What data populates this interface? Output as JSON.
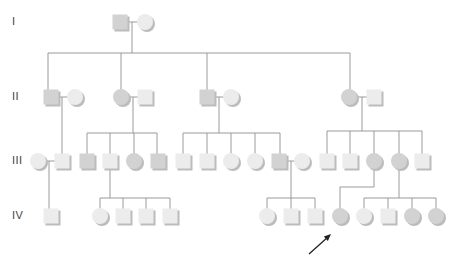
{
  "diagram": {
    "type": "pedigree",
    "colors": {
      "line": "#9a9a9a",
      "unaffected_fill": "#ececec",
      "affected_fill": "#d2d2d2",
      "shadow": "#bcbcbc",
      "arrow": "#222222",
      "label": "#444444"
    },
    "generation_labels": [
      {
        "label": "I",
        "y": 22
      },
      {
        "label": "II",
        "y": 97
      },
      {
        "label": "III",
        "y": 161
      },
      {
        "label": "IV",
        "y": 216
      }
    ],
    "individuals": [
      {
        "id": "I-1",
        "sex": "male",
        "x": 120,
        "y": 22,
        "affected": true
      },
      {
        "id": "I-2",
        "sex": "female",
        "x": 145,
        "y": 22,
        "affected": false
      },
      {
        "id": "II-1",
        "sex": "male",
        "x": 51,
        "y": 97,
        "affected": true
      },
      {
        "id": "II-2",
        "sex": "female",
        "x": 75,
        "y": 97,
        "affected": false
      },
      {
        "id": "II-3",
        "sex": "female",
        "x": 121,
        "y": 97,
        "affected": true
      },
      {
        "id": "II-4",
        "sex": "male",
        "x": 145,
        "y": 97,
        "affected": false
      },
      {
        "id": "II-5",
        "sex": "male",
        "x": 207,
        "y": 97,
        "affected": true
      },
      {
        "id": "II-6",
        "sex": "female",
        "x": 231,
        "y": 97,
        "affected": false
      },
      {
        "id": "II-7",
        "sex": "female",
        "x": 349,
        "y": 97,
        "affected": true
      },
      {
        "id": "II-8",
        "sex": "male",
        "x": 374,
        "y": 97,
        "affected": false
      },
      {
        "id": "III-1",
        "sex": "female",
        "x": 38,
        "y": 161,
        "affected": false
      },
      {
        "id": "III-2",
        "sex": "male",
        "x": 62,
        "y": 161,
        "affected": false
      },
      {
        "id": "III-3",
        "sex": "male",
        "x": 87,
        "y": 161,
        "affected": true
      },
      {
        "id": "III-4",
        "sex": "male",
        "x": 110,
        "y": 161,
        "affected": false
      },
      {
        "id": "III-5",
        "sex": "female",
        "x": 134,
        "y": 161,
        "affected": true
      },
      {
        "id": "III-6",
        "sex": "male",
        "x": 158,
        "y": 161,
        "affected": true
      },
      {
        "id": "III-7",
        "sex": "male",
        "x": 183,
        "y": 161,
        "affected": false
      },
      {
        "id": "III-8",
        "sex": "male",
        "x": 207,
        "y": 161,
        "affected": false
      },
      {
        "id": "III-9",
        "sex": "female",
        "x": 231,
        "y": 161,
        "affected": false
      },
      {
        "id": "III-10",
        "sex": "female",
        "x": 255,
        "y": 161,
        "affected": false
      },
      {
        "id": "III-11",
        "sex": "male",
        "x": 279,
        "y": 161,
        "affected": true
      },
      {
        "id": "III-12",
        "sex": "female",
        "x": 302,
        "y": 161,
        "affected": false
      },
      {
        "id": "III-13",
        "sex": "male",
        "x": 327,
        "y": 161,
        "affected": false
      },
      {
        "id": "III-14",
        "sex": "male",
        "x": 350,
        "y": 161,
        "affected": false
      },
      {
        "id": "III-15",
        "sex": "female",
        "x": 374,
        "y": 161,
        "affected": true
      },
      {
        "id": "III-16",
        "sex": "female",
        "x": 399,
        "y": 161,
        "affected": true
      },
      {
        "id": "III-17",
        "sex": "male",
        "x": 422,
        "y": 161,
        "affected": false
      },
      {
        "id": "IV-1",
        "sex": "male",
        "x": 51,
        "y": 216,
        "affected": false
      },
      {
        "id": "IV-2",
        "sex": "female",
        "x": 100,
        "y": 216,
        "affected": false
      },
      {
        "id": "IV-3",
        "sex": "male",
        "x": 123,
        "y": 216,
        "affected": false
      },
      {
        "id": "IV-4",
        "sex": "male",
        "x": 146,
        "y": 216,
        "affected": false
      },
      {
        "id": "IV-5",
        "sex": "male",
        "x": 170,
        "y": 216,
        "affected": false
      },
      {
        "id": "IV-6",
        "sex": "female",
        "x": 267,
        "y": 216,
        "affected": false
      },
      {
        "id": "IV-7",
        "sex": "male",
        "x": 291,
        "y": 216,
        "affected": false
      },
      {
        "id": "IV-8",
        "sex": "male",
        "x": 315,
        "y": 216,
        "affected": false
      },
      {
        "id": "IV-9",
        "sex": "female",
        "x": 340,
        "y": 216,
        "affected": true,
        "proband": true
      },
      {
        "id": "IV-10",
        "sex": "female",
        "x": 364,
        "y": 216,
        "affected": false
      },
      {
        "id": "IV-11",
        "sex": "male",
        "x": 388,
        "y": 216,
        "affected": false
      },
      {
        "id": "IV-12",
        "sex": "female",
        "x": 412,
        "y": 216,
        "affected": true
      },
      {
        "id": "IV-13",
        "sex": "female",
        "x": 436,
        "y": 216,
        "affected": true
      }
    ],
    "lines": [
      [
        132,
        22,
        132,
        53
      ],
      [
        48,
        53,
        350,
        53
      ],
      [
        48,
        53,
        48,
        90
      ],
      [
        121,
        53,
        121,
        90
      ],
      [
        207,
        53,
        207,
        90
      ],
      [
        350,
        53,
        350,
        90
      ],
      [
        62,
        97,
        62,
        155
      ],
      [
        133,
        97,
        133,
        133
      ],
      [
        87,
        133,
        157,
        133
      ],
      [
        87,
        133,
        87,
        154
      ],
      [
        110,
        133,
        110,
        154
      ],
      [
        134,
        133,
        134,
        154
      ],
      [
        157,
        133,
        157,
        154
      ],
      [
        219,
        97,
        219,
        133
      ],
      [
        183,
        133,
        280,
        133
      ],
      [
        183,
        133,
        183,
        154
      ],
      [
        207,
        133,
        207,
        154
      ],
      [
        231,
        133,
        231,
        154
      ],
      [
        255,
        133,
        255,
        154
      ],
      [
        280,
        133,
        280,
        154
      ],
      [
        362,
        97,
        362,
        131
      ],
      [
        327,
        131,
        422,
        131
      ],
      [
        327,
        131,
        327,
        154
      ],
      [
        350,
        131,
        350,
        154
      ],
      [
        374,
        131,
        374,
        154
      ],
      [
        399,
        131,
        399,
        154
      ],
      [
        422,
        131,
        422,
        154
      ],
      [
        49,
        161,
        49,
        209
      ],
      [
        110,
        161,
        110,
        198
      ],
      [
        100,
        198,
        170,
        198
      ],
      [
        100,
        198,
        100,
        209
      ],
      [
        123,
        198,
        123,
        209
      ],
      [
        146,
        198,
        146,
        209
      ],
      [
        170,
        198,
        170,
        209
      ],
      [
        291,
        161,
        291,
        198
      ],
      [
        267,
        198,
        315,
        198
      ],
      [
        267,
        198,
        267,
        209
      ],
      [
        291,
        198,
        291,
        209
      ],
      [
        315,
        198,
        315,
        209
      ],
      [
        374,
        161,
        374,
        187
      ],
      [
        340,
        187,
        374,
        187
      ],
      [
        340,
        187,
        340,
        209
      ],
      [
        399,
        161,
        399,
        198
      ],
      [
        364,
        198,
        436,
        198
      ],
      [
        364,
        198,
        364,
        209
      ],
      [
        388,
        198,
        388,
        209
      ],
      [
        412,
        198,
        412,
        209
      ],
      [
        436,
        198,
        436,
        209
      ]
    ],
    "couple_links": [
      [
        127,
        22,
        138,
        22
      ],
      [
        58,
        97,
        68,
        97
      ],
      [
        128,
        97,
        138,
        97
      ],
      [
        214,
        97,
        224,
        97
      ],
      [
        356,
        97,
        367,
        97
      ],
      [
        45,
        161,
        55,
        161
      ],
      [
        286,
        161,
        295,
        161
      ]
    ],
    "proband_arrow": {
      "x1": 309,
      "y1": 254,
      "x2": 331,
      "y2": 234
    }
  }
}
